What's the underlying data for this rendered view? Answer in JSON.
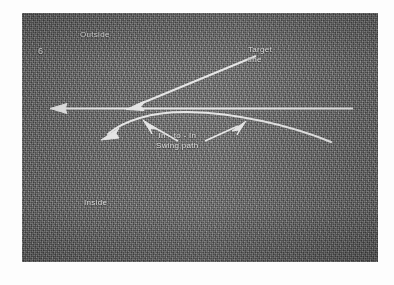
{
  "image": {
    "kind": "scanned-photograph-diagram",
    "subject": "golf swing path illustration",
    "background_color": "#6b6b6b",
    "annotation_color": "#e8e8e8",
    "page_color": "#fdfdfd"
  },
  "labels": {
    "figure_number": "6",
    "outside": "Outside",
    "inside": "Inside",
    "target_line_1": "Target",
    "target_line_2": "line",
    "swing_path_1": "In - to - In",
    "swing_path_2": "Swing path"
  },
  "diagram_data": {
    "type": "diagram",
    "elements": [
      {
        "name": "target-line",
        "description": "straight horizontal line with left-pointing arrowhead",
        "from": [
          330,
          96
        ],
        "to": [
          30,
          96
        ],
        "arrow": "left"
      },
      {
        "name": "swing-path-curve",
        "description": "in-to-in curved swing path arc crossing the target line, left-pointing arrowhead",
        "from": [
          308,
          128
        ],
        "control": [
          170,
          100
        ],
        "to": [
          84,
          121
        ],
        "arrow": "left"
      },
      {
        "name": "target-line-leader",
        "description": "diagonal leader arrow from Target line label down to the target line",
        "from": [
          232,
          44
        ],
        "to": [
          108,
          95
        ],
        "arrow": "down-left"
      },
      {
        "name": "swing-path-leader-left",
        "description": "leader arrow from swing path label up-left to the arc",
        "from": [
          152,
          124
        ],
        "to": [
          123,
          110
        ],
        "arrow": "up-left"
      },
      {
        "name": "swing-path-leader-right",
        "description": "leader arrow from swing path label up-right to the arc",
        "from": [
          185,
          124
        ],
        "to": [
          222,
          110
        ],
        "arrow": "up-right"
      }
    ]
  }
}
